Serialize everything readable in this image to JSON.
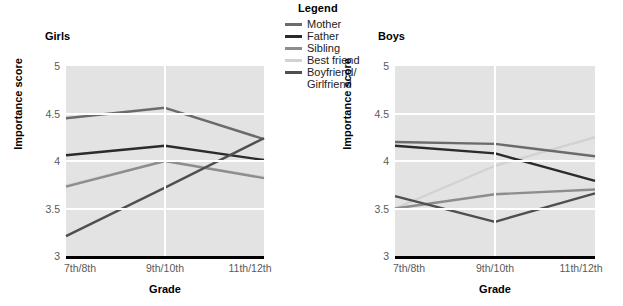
{
  "legend": {
    "title": "Legend",
    "items": [
      {
        "label": "Mother",
        "color": "#6b6b6b"
      },
      {
        "label": "Father",
        "color": "#2b2b2b"
      },
      {
        "label": "Sibling",
        "color": "#8d8d8d"
      },
      {
        "label": "Best friend",
        "color": "#d2d2d2"
      },
      {
        "label": "Boyfriend/\nGirlfriend",
        "color": "#4f4f4f"
      }
    ]
  },
  "panels": [
    {
      "key": "girls",
      "title": "Girls",
      "ylabel": "Importance score",
      "xlabel": "Grade"
    },
    {
      "key": "boys",
      "title": "Boys",
      "ylabel": "Importance score",
      "xlabel": "Grade"
    }
  ],
  "axis": {
    "yticks": [
      "5",
      "4.5",
      "4",
      "3.5",
      "3"
    ],
    "ytick_values": [
      5,
      4.5,
      4,
      3.5,
      3
    ],
    "xticks": [
      "7th/8th",
      "9th/10th",
      "11th/12th"
    ]
  },
  "chart_data": [
    {
      "type": "line",
      "title": "Girls",
      "xlabel": "Grade",
      "ylabel": "Importance score",
      "categories": [
        "7th/8th",
        "9th/10th",
        "11th/12th"
      ],
      "ylim": [
        3,
        5
      ],
      "yticks": [
        3,
        3.5,
        4,
        4.5,
        5
      ],
      "grid": true,
      "legend_position": "top-center-between-panels",
      "series": [
        {
          "name": "Mother",
          "color": "#6b6b6b",
          "values": [
            4.45,
            4.56,
            4.23
          ]
        },
        {
          "name": "Father",
          "color": "#2b2b2b",
          "values": [
            4.06,
            4.16,
            4.01
          ]
        },
        {
          "name": "Sibling",
          "color": "#8d8d8d",
          "values": [
            3.73,
            4.0,
            3.82
          ]
        },
        {
          "name": "Best friend",
          "color": "#d2d2d2",
          "values": [
            3.74,
            4.0,
            3.83
          ]
        },
        {
          "name": "Boyfriend/Girlfriend",
          "color": "#4f4f4f",
          "values": [
            3.21,
            3.72,
            4.24
          ]
        }
      ]
    },
    {
      "type": "line",
      "title": "Boys",
      "xlabel": "Grade",
      "ylabel": "Importance score",
      "categories": [
        "7th/8th",
        "9th/10th",
        "11th/12th"
      ],
      "ylim": [
        3,
        5
      ],
      "yticks": [
        3,
        3.5,
        4,
        4.5,
        5
      ],
      "grid": true,
      "legend_position": "top-center-between-panels",
      "series": [
        {
          "name": "Mother",
          "color": "#6b6b6b",
          "values": [
            4.2,
            4.18,
            4.05
          ]
        },
        {
          "name": "Father",
          "color": "#2b2b2b",
          "values": [
            4.16,
            4.08,
            3.79
          ]
        },
        {
          "name": "Sibling",
          "color": "#8d8d8d",
          "values": [
            3.5,
            3.65,
            3.7
          ]
        },
        {
          "name": "Best friend",
          "color": "#d2d2d2",
          "values": [
            3.5,
            3.95,
            4.25
          ]
        },
        {
          "name": "Boyfriend/Girlfriend",
          "color": "#4f4f4f",
          "values": [
            3.63,
            3.36,
            3.66
          ]
        }
      ]
    }
  ]
}
